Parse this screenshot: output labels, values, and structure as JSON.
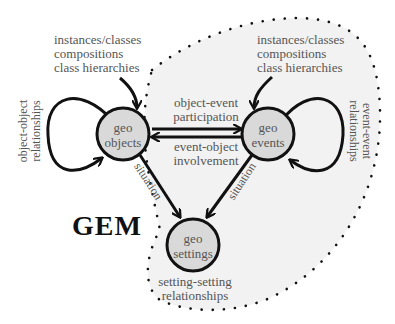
{
  "title": "GEM",
  "colors": {
    "background": "#ffffff",
    "region_fill": "#f2f2f2",
    "node_fill": "#d9d9d9",
    "stroke": "#111111",
    "text": "#555555"
  },
  "nodes": {
    "objects": {
      "line1": "geo",
      "line2": "objects"
    },
    "events": {
      "line1": "geo",
      "line2": "events"
    },
    "settings": {
      "line1": "geo",
      "line2": "settings"
    }
  },
  "annotations": {
    "objects_input": {
      "line1": "instances/classes",
      "line2": "compositions",
      "line3": "class hierarchies"
    },
    "events_input": {
      "line1": "instances/classes",
      "line2": "compositions",
      "line3": "class hierarchies"
    },
    "object_object": {
      "line1": "object-object",
      "line2": "relationships"
    },
    "event_event": {
      "line1": "event-event",
      "line2": "relationships"
    },
    "object_event": {
      "line1": "object-event",
      "line2": "participation"
    },
    "event_object": {
      "line1": "event-object",
      "line2": "involvement"
    },
    "situation_left": "situation",
    "situation_right": "situation",
    "setting_setting": {
      "line1": "setting-setting",
      "line2": "relationships"
    }
  }
}
